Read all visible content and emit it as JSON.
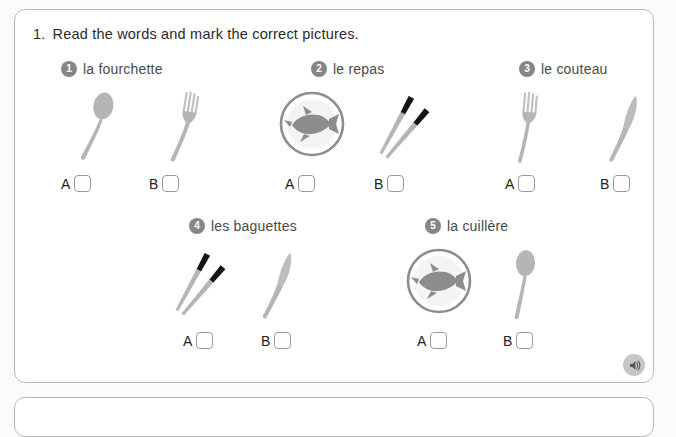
{
  "colors": {
    "panel_border": "#b9b9b9",
    "panel_bg": "#ffffff",
    "page_bg": "#fbfbfb",
    "badge_bg": "#868686",
    "badge_text": "#ffffff",
    "label_text": "#4a4a4a",
    "title_text": "#2b2b2b",
    "checkbox_border": "#9a9a9a",
    "utensil_grey": "#b5b5b5",
    "utensil_grey_dark": "#9e9e9e",
    "plate_grey": "#8d8d8d",
    "chopstick_tip": "#141414",
    "audio_circle": "#c6c6c6"
  },
  "exercise": {
    "number": "1.",
    "instruction": "Read the words and mark the correct pictures.",
    "items": [
      {
        "number": "1",
        "label": "la fourchette",
        "options": [
          {
            "letter": "A",
            "picture": "spoon-icon",
            "checked": false
          },
          {
            "letter": "B",
            "picture": "fork-icon",
            "checked": false
          }
        ]
      },
      {
        "number": "2",
        "label": "le repas",
        "options": [
          {
            "letter": "A",
            "picture": "plate-with-fish-icon",
            "checked": false
          },
          {
            "letter": "B",
            "picture": "chopsticks-icon",
            "checked": false
          }
        ]
      },
      {
        "number": "3",
        "label": "le couteau",
        "options": [
          {
            "letter": "A",
            "picture": "fork-icon",
            "checked": false
          },
          {
            "letter": "B",
            "picture": "knife-icon",
            "checked": false
          }
        ]
      },
      {
        "number": "4",
        "label": "les baguettes",
        "options": [
          {
            "letter": "A",
            "picture": "chopsticks-icon",
            "checked": false
          },
          {
            "letter": "B",
            "picture": "knife-icon",
            "checked": false
          }
        ]
      },
      {
        "number": "5",
        "label": "la cuillère",
        "options": [
          {
            "letter": "A",
            "picture": "plate-with-fish-icon",
            "checked": false
          },
          {
            "letter": "B",
            "picture": "spoon-icon",
            "checked": false
          }
        ]
      }
    ]
  },
  "audio": {
    "icon": "speaker-icon",
    "label": "Play audio"
  }
}
